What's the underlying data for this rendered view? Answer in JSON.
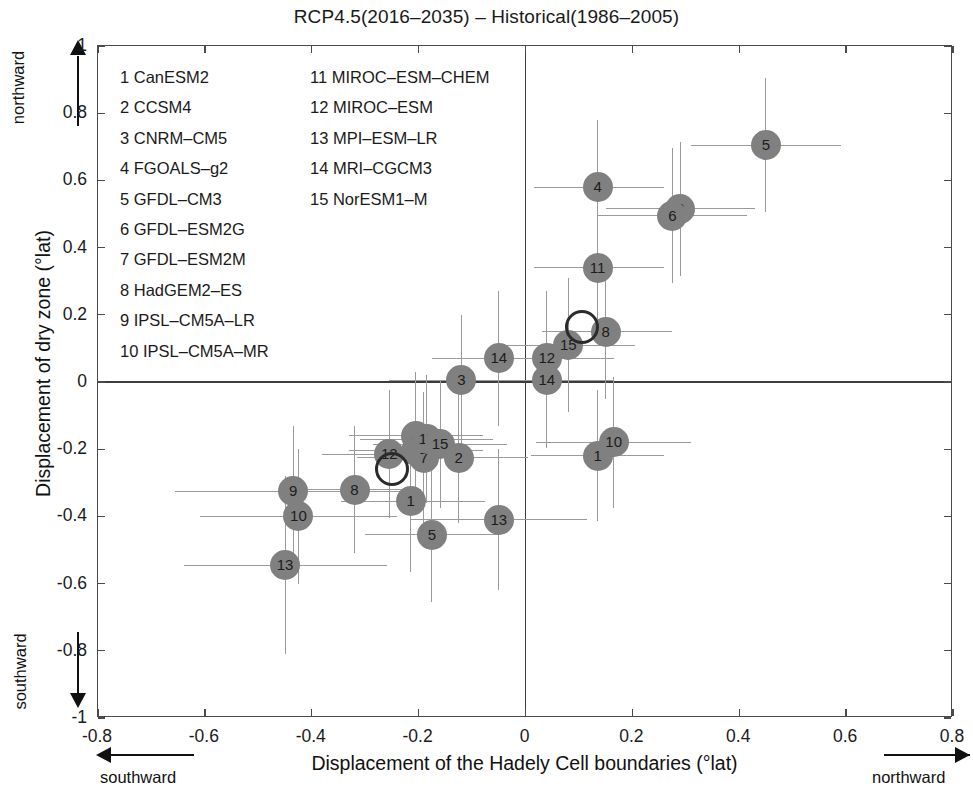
{
  "chart_data": {
    "type": "scatter",
    "title": "RCP4.5(2016–2035) – Historical(1986–2005)",
    "xlabel": "Displacement of the Hadely Cell boundaries (°lat)",
    "ylabel": "Displacement of dry zone (°lat)",
    "xlim": [
      -0.8,
      0.8
    ],
    "ylim": [
      -1,
      1
    ],
    "xticks": [
      "-0.8",
      "-0.6",
      "-0.4",
      "-0.2",
      "0",
      "0.2",
      "0.4",
      "0.6",
      "0.8"
    ],
    "xtickvals": [
      -0.8,
      -0.6,
      -0.4,
      -0.2,
      0,
      0.2,
      0.4,
      0.6,
      0.8
    ],
    "yticks": [
      "1",
      "0.8",
      "0.6",
      "0.4",
      "0.2",
      "0",
      "-0.2",
      "-0.4",
      "-0.6",
      "-0.8",
      "-1"
    ],
    "ytickvals": [
      1,
      0.8,
      0.6,
      0.4,
      0.2,
      0,
      -0.2,
      -0.4,
      -0.6,
      -0.8,
      -1
    ],
    "grid": false,
    "legend_position": "upper-left-inside",
    "marker_color": "#808080",
    "errorbar_color": "#9a9a9a",
    "ensemble_marker_color": "#2b2b2b",
    "annotations": {
      "x_negative": "southward",
      "x_positive": "northward",
      "y_positive": "northward",
      "y_negative": "southward"
    },
    "series": [
      {
        "name": "CMIP5 models (group A)",
        "points": [
          {
            "label": "1",
            "x": -0.215,
            "y": -0.355,
            "xerr": [
              -0.345,
              -0.075
            ],
            "yerr": [
              -0.565,
              -0.145
            ]
          },
          {
            "label": "2",
            "x": -0.125,
            "y": -0.225,
            "xerr": [
              -0.25,
              0.005
            ],
            "yerr": [
              -0.42,
              -0.03
            ]
          },
          {
            "label": "3",
            "x": -0.205,
            "y": -0.205,
            "xerr": [
              -0.33,
              -0.08
            ],
            "yerr": [
              -0.395,
              -0.015
            ]
          },
          {
            "label": "4",
            "x": -0.205,
            "y": -0.16,
            "xerr": [
              -0.33,
              -0.08
            ],
            "yerr": [
              -0.35,
              0.03
            ]
          },
          {
            "label": "5",
            "x": -0.175,
            "y": -0.455,
            "xerr": [
              -0.3,
              -0.05
            ],
            "yerr": [
              -0.655,
              -0.255
            ]
          },
          {
            "label": "7",
            "x": -0.19,
            "y": -0.225,
            "xerr": [
              -0.315,
              -0.065
            ],
            "yerr": [
              -0.42,
              -0.03
            ]
          },
          {
            "label": "8",
            "x": -0.32,
            "y": -0.32,
            "xerr": [
              -0.445,
              -0.195
            ],
            "yerr": [
              -0.51,
              -0.13
            ]
          },
          {
            "label": "9",
            "x": -0.435,
            "y": -0.325,
            "xerr": [
              -0.655,
              -0.215
            ],
            "yerr": [
              -0.52,
              -0.13
            ]
          },
          {
            "label": "10",
            "x": -0.425,
            "y": -0.4,
            "xerr": [
              -0.61,
              -0.24
            ],
            "yerr": [
              -0.6,
              -0.2
            ]
          },
          {
            "label": "11",
            "x": -0.185,
            "y": -0.17,
            "xerr": [
              -0.31,
              -0.06
            ],
            "yerr": [
              -0.36,
              0.02
            ]
          },
          {
            "label": "12",
            "x": -0.255,
            "y": -0.215,
            "xerr": [
              -0.38,
              -0.13
            ],
            "yerr": [
              -0.405,
              -0.025
            ]
          },
          {
            "label": "13",
            "x": -0.45,
            "y": -0.545,
            "xerr": [
              -0.64,
              -0.26
            ],
            "yerr": [
              -0.81,
              -0.28
            ]
          },
          {
            "label": "13",
            "x": -0.05,
            "y": -0.41,
            "xerr": [
              -0.215,
              0.115
            ],
            "yerr": [
              -0.62,
              -0.2
            ]
          },
          {
            "label": "15",
            "x": -0.16,
            "y": -0.185,
            "xerr": [
              -0.285,
              -0.035
            ],
            "yerr": [
              -0.375,
              0.005
            ]
          },
          {
            "label": "3",
            "x": -0.12,
            "y": 0.005,
            "xerr": [
              -0.255,
              0.015
            ],
            "yerr": [
              -0.19,
              0.2
            ]
          },
          {
            "label": "1",
            "x": 0.135,
            "y": -0.22,
            "xerr": [
              0.01,
              0.26
            ],
            "yerr": [
              -0.415,
              -0.025
            ]
          },
          {
            "label": "10",
            "x": 0.165,
            "y": -0.18,
            "xerr": [
              0.02,
              0.31
            ],
            "yerr": [
              -0.375,
              0.015
            ]
          }
        ]
      },
      {
        "name": "CMIP5 models (group B)",
        "points": [
          {
            "label": "5",
            "x": 0.45,
            "y": 0.705,
            "xerr": [
              0.31,
              0.59
            ],
            "yerr": [
              0.505,
              0.905
            ]
          },
          {
            "label": "4",
            "x": 0.135,
            "y": 0.58,
            "xerr": [
              0.015,
              0.26
            ],
            "yerr": [
              0.38,
              0.78
            ]
          },
          {
            "label": "9",
            "x": 0.29,
            "y": 0.515,
            "xerr": [
              0.15,
              0.43
            ],
            "yerr": [
              0.315,
              0.715
            ]
          },
          {
            "label": "6",
            "x": 0.275,
            "y": 0.495,
            "xerr": [
              0.135,
              0.415
            ],
            "yerr": [
              0.295,
              0.695
            ]
          },
          {
            "label": "11",
            "x": 0.135,
            "y": 0.34,
            "xerr": [
              0.015,
              0.26
            ],
            "yerr": [
              0.14,
              0.54
            ]
          },
          {
            "label": "8",
            "x": 0.15,
            "y": 0.15,
            "xerr": [
              0.03,
              0.275
            ],
            "yerr": [
              -0.05,
              0.35
            ]
          },
          {
            "label": "15",
            "x": 0.08,
            "y": 0.11,
            "xerr": [
              -0.045,
              0.205
            ],
            "yerr": [
              -0.09,
              0.31
            ]
          },
          {
            "label": "12",
            "x": 0.04,
            "y": 0.07,
            "xerr": [
              -0.085,
              0.165
            ],
            "yerr": [
              -0.13,
              0.27
            ]
          },
          {
            "label": "14",
            "x": 0.04,
            "y": 0.005,
            "xerr": [
              -0.085,
              0.165
            ],
            "yerr": [
              -0.195,
              0.205
            ]
          },
          {
            "label": "14",
            "x": -0.05,
            "y": 0.07,
            "xerr": [
              -0.175,
              0.075
            ],
            "yerr": [
              -0.13,
              0.27
            ]
          }
        ]
      },
      {
        "name": "Ensemble mean",
        "is_ensemble": true,
        "points": [
          {
            "label": "",
            "x": -0.25,
            "y": -0.26
          },
          {
            "label": "",
            "x": 0.105,
            "y": 0.165
          }
        ]
      }
    ]
  },
  "legend": {
    "left_column": [
      {
        "num": "1",
        "model": "CanESM2"
      },
      {
        "num": "2",
        "model": "CCSM4"
      },
      {
        "num": "3",
        "model": "CNRM–CM5"
      },
      {
        "num": "4",
        "model": "FGOALS–g2"
      },
      {
        "num": "5",
        "model": "GFDL–CM3"
      },
      {
        "num": "6",
        "model": "GFDL–ESM2G"
      },
      {
        "num": "7",
        "model": "GFDL–ESM2M"
      },
      {
        "num": "8",
        "model": "HadGEM2–ES"
      },
      {
        "num": "9",
        "model": "IPSL–CM5A–LR"
      },
      {
        "num": "10",
        "model": "IPSL–CM5A–MR"
      }
    ],
    "right_column": [
      {
        "num": "11",
        "model": "MIROC–ESM–CHEM"
      },
      {
        "num": "12",
        "model": "MIROC–ESM"
      },
      {
        "num": "13",
        "model": "MPI–ESM–LR"
      },
      {
        "num": "14",
        "model": "MRI–CGCM3"
      },
      {
        "num": "15",
        "model": "NorESM1–M"
      }
    ]
  }
}
